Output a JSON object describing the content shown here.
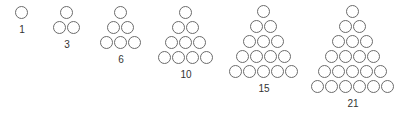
{
  "diagram": {
    "circle_color": "#6b6b6b",
    "triangles": [
      {
        "rows": 1,
        "label": "1",
        "apex_x": 22,
        "apex_y": 13
      },
      {
        "rows": 2,
        "label": "3",
        "apex_x": 67,
        "apex_y": 13
      },
      {
        "rows": 3,
        "label": "6",
        "apex_x": 121,
        "apex_y": 13
      },
      {
        "rows": 4,
        "label": "10",
        "apex_x": 186,
        "apex_y": 13
      },
      {
        "rows": 5,
        "label": "15",
        "apex_x": 264,
        "apex_y": 12
      },
      {
        "rows": 6,
        "label": "21",
        "apex_x": 353,
        "apex_y": 12
      }
    ],
    "spacing_x": 14,
    "spacing_y": 15
  }
}
